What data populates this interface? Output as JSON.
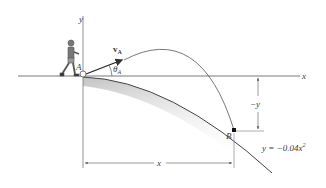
{
  "diagram": {
    "type": "projectile-motion-on-slope",
    "labels": {
      "y_axis": "y",
      "x_axis": "x",
      "point_a": "A",
      "point_b": "B",
      "velocity": "v",
      "velocity_sub": "A",
      "angle": "θ",
      "angle_sub": "A",
      "vertical_dim": "−y",
      "horizontal_dim": "x",
      "equation": "y = −0.04x",
      "equation_exp": "2"
    },
    "colors": {
      "line": "#4a4a4a",
      "shadow": "#c8c8c8",
      "background": "#ffffff"
    }
  }
}
